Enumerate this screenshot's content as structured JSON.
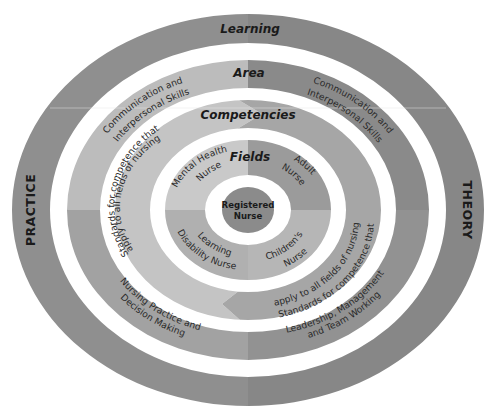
{
  "diagram": {
    "colors": {
      "background": "#ffffff",
      "outer_left": "#8f8f8f",
      "outer_right": "#878787",
      "area_top_left": "#bcbcbc",
      "area_bottom_left": "#a2a2a2",
      "area_top_right": "#8a8a8a",
      "area_bottom_right": "#929292",
      "competencies_left": "#c4c4c4",
      "competencies_right": "#a6a6a6",
      "fields_top_left": "#c9c9c9",
      "fields_top_right": "#9b9b9b",
      "fields_bottom_left": "#b0b0b0",
      "fields_bottom_right": "#b6b6b6",
      "center": "#8b8b8b",
      "text": "#1a1a1a"
    },
    "rings": {
      "outer": {
        "title": "Learning",
        "left_label": "PRACTICE",
        "right_label": "THEORY"
      },
      "area": {
        "title": "Area",
        "segments": {
          "top_left": [
            "Communication and",
            "Interpersonal Skills"
          ],
          "top_right": [
            "Communication and",
            "Interpersonal Skills"
          ],
          "bottom_left": [
            "Nursing Practice and",
            "Decision Making"
          ],
          "bottom_right": [
            "Leadership, Management",
            "and Team Working"
          ]
        }
      },
      "competencies": {
        "title": "Competencies",
        "segments": {
          "left": [
            "Standards for competence that",
            "apply to all fields of nursing"
          ],
          "right": [
            "Standards for competence that",
            "apply to all fields of nursing"
          ]
        }
      },
      "fields": {
        "title": "Fields",
        "segments": {
          "top_left": [
            "Mental Health",
            "Nurse"
          ],
          "top_right": [
            "Adult",
            "Nurse"
          ],
          "bottom_left": [
            "Learning",
            "Disability Nurse"
          ],
          "bottom_right": [
            "Children's",
            "Nurse"
          ]
        }
      },
      "center": {
        "lines": [
          "Registered",
          "Nurse"
        ]
      }
    }
  }
}
